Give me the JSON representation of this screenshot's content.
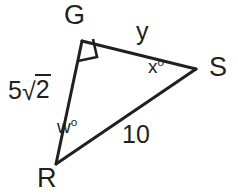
{
  "figure": {
    "background_color": "#ffffff",
    "stroke_color": "#231f20",
    "stroke_width": 3,
    "vertices": {
      "G": {
        "x": 82,
        "y": 41,
        "label": "G"
      },
      "S": {
        "x": 196,
        "y": 69,
        "label": "S"
      },
      "R": {
        "x": 56,
        "y": 164,
        "label": "R"
      }
    },
    "right_angle": {
      "at": "G",
      "marker": "square",
      "size": 20
    },
    "sides": [
      {
        "name": "GR",
        "label": "5√2",
        "label_parts": {
          "coefficient": "5",
          "radical": "√",
          "radicand": "2"
        }
      },
      {
        "name": "GS",
        "label": "y"
      },
      {
        "name": "RS",
        "label": "10"
      }
    ],
    "angles": [
      {
        "at": "S",
        "label": "x",
        "degree_symbol": "o",
        "full": "xº"
      },
      {
        "at": "R",
        "label": "w",
        "degree_symbol": "o",
        "full": "wº"
      }
    ]
  }
}
